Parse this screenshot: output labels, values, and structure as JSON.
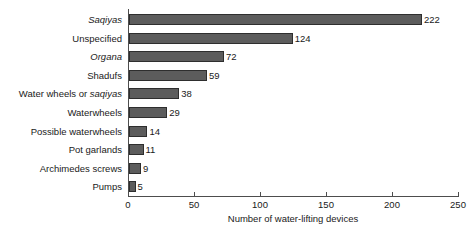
{
  "chart_data": {
    "type": "bar",
    "orientation": "horizontal",
    "title": "",
    "xlabel": "Number of water-lifting devices",
    "ylabel": "",
    "xlim": [
      0,
      250
    ],
    "xticks": [
      0,
      50,
      100,
      150,
      200,
      250
    ],
    "grid": false,
    "legend": null,
    "bar_color": "#5c5c5c",
    "bar_edge_color": "#2e2e2e",
    "axis_color": "#4d4d4d",
    "categories": [
      "Saqiyas",
      "Unspecified",
      "Organa",
      "Shadufs",
      "Water wheels or saqiyas",
      "Waterwheels",
      "Possible waterwheels",
      "Pot garlands",
      "Archimedes screws",
      "Pumps"
    ],
    "values": [
      222,
      124,
      72,
      59,
      38,
      29,
      14,
      11,
      9,
      5
    ],
    "value_labels": [
      "222",
      "124",
      "72",
      "59",
      "38",
      "29",
      "14",
      "11",
      "9",
      "5"
    ],
    "category_label_parts": [
      [
        {
          "text": "Saqiyas",
          "italic": true
        }
      ],
      [
        {
          "text": "Unspecified",
          "italic": false
        }
      ],
      [
        {
          "text": "Organa",
          "italic": true
        }
      ],
      [
        {
          "text": "Shadufs",
          "italic": false
        }
      ],
      [
        {
          "text": "Water wheels or ",
          "italic": false
        },
        {
          "text": "saqiyas",
          "italic": true
        }
      ],
      [
        {
          "text": "Waterwheels",
          "italic": false
        }
      ],
      [
        {
          "text": "Possible waterwheels",
          "italic": false
        }
      ],
      [
        {
          "text": "Pot garlands",
          "italic": false
        }
      ],
      [
        {
          "text": "Archimedes screws",
          "italic": false
        }
      ],
      [
        {
          "text": "Pumps",
          "italic": false
        }
      ]
    ]
  }
}
